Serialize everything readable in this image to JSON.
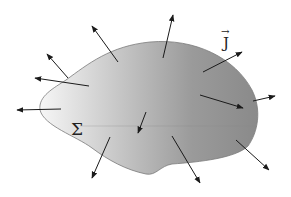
{
  "diagram": {
    "surface_label": "Σ",
    "vector_label": "J",
    "vector_accent": "→",
    "colors": {
      "surface_dark": "#8c8c8c",
      "surface_light": "#f4f4f4",
      "outline": "#7a7a7a",
      "arrow": "#1a1a1a"
    },
    "arrows": [
      {
        "x1": 118,
        "y1": 62,
        "x2": 92,
        "y2": 26
      },
      {
        "x1": 68,
        "y1": 78,
        "x2": 47,
        "y2": 54
      },
      {
        "x1": 89,
        "y1": 86,
        "x2": 35,
        "y2": 78
      },
      {
        "x1": 163,
        "y1": 58,
        "x2": 173,
        "y2": 15
      },
      {
        "x1": 203,
        "y1": 72,
        "x2": 242,
        "y2": 52
      },
      {
        "x1": 200,
        "y1": 95,
        "x2": 243,
        "y2": 108
      },
      {
        "x1": 253,
        "y1": 101,
        "x2": 275,
        "y2": 96
      },
      {
        "x1": 61,
        "y1": 109,
        "x2": 17,
        "y2": 110
      },
      {
        "x1": 110,
        "y1": 137,
        "x2": 92,
        "y2": 178
      },
      {
        "x1": 146,
        "y1": 112,
        "x2": 138,
        "y2": 133
      },
      {
        "x1": 172,
        "y1": 136,
        "x2": 200,
        "y2": 183
      },
      {
        "x1": 236,
        "y1": 140,
        "x2": 269,
        "y2": 170
      }
    ]
  }
}
